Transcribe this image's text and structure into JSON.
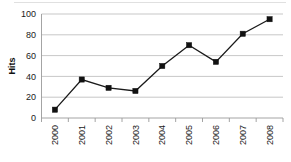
{
  "chart_data": {
    "type": "line",
    "title": "",
    "subtitle": "",
    "xlabel": "",
    "ylabel": "Hits",
    "categories": [
      "2000",
      "2001",
      "2002",
      "2003",
      "2004",
      "2005",
      "2006",
      "2007",
      "2008"
    ],
    "values": [
      8,
      37,
      29,
      26,
      50,
      70,
      54,
      81,
      95
    ],
    "series": [
      {
        "name": "Hits",
        "values": [
          8,
          37,
          29,
          26,
          50,
          70,
          54,
          81,
          95
        ]
      }
    ],
    "ylim": [
      0,
      100
    ],
    "ytick_labels": [
      "0",
      "20",
      "40",
      "60",
      "80",
      "100"
    ],
    "yticks": [
      0,
      20,
      40,
      60,
      80,
      100
    ],
    "xtick_labels": [
      "2000",
      "2001",
      "2002",
      "2003",
      "2004",
      "2005",
      "2006",
      "2007",
      "2008"
    ],
    "xtick_rotation": 90,
    "grid": "horizontal",
    "legend": "none",
    "marker": "square",
    "colors": {
      "line": "#1a1a1a",
      "marker": "#111111",
      "gridline": "#b9b9b9",
      "axis": "#9a9a9a",
      "background": "#ffffff",
      "text": "#1a1a1a"
    }
  }
}
